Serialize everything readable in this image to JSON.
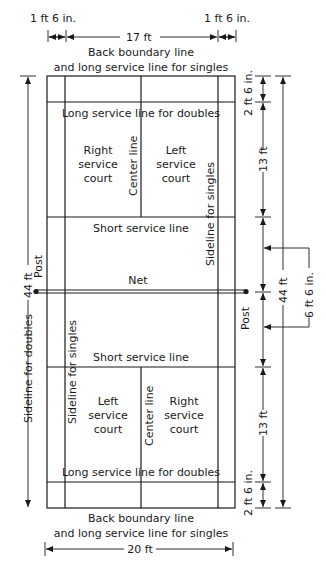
{
  "diagram": {
    "top_dims": {
      "left_alley": "1 ft 6 in.",
      "singles_width": "17 ft",
      "right_alley": "1 ft 6 in."
    },
    "top_label_1": "Back boundary line",
    "top_label_2": "and long service line for singles",
    "bottom_label_1": "Back boundary line",
    "bottom_label_2": "and long service line for singles",
    "bottom_dim": "20 ft",
    "upper_half": {
      "long_service_doubles": "Long service line for doubles",
      "right_court": [
        "Right",
        "service",
        "court"
      ],
      "left_court": [
        "Left",
        "service",
        "court"
      ],
      "center_line": "Center line",
      "singles_sideline": "Sideline for singles",
      "short_service": "Short service line"
    },
    "net": {
      "label": "Net",
      "post_left": "Post",
      "post_right": "Post"
    },
    "lower_half": {
      "short_service": "Short service line",
      "singles_sideline": "Sideline for singles",
      "left_court": [
        "Left",
        "service",
        "court"
      ],
      "right_court": [
        "Right",
        "service",
        "court"
      ],
      "center_line": "Center line",
      "long_service_doubles": "Long service line for doubles"
    },
    "left_dims": {
      "total_length": "44 ft",
      "doubles_sideline": "Sideline for doubles"
    },
    "right_dims": {
      "top_back": "2 ft 6 in.",
      "top_service": "13 ft",
      "bottom_service": "13 ft",
      "bottom_back": "2 ft 6 in.",
      "total_length": "44 ft",
      "service_gap": "6 ft 6 in."
    }
  }
}
